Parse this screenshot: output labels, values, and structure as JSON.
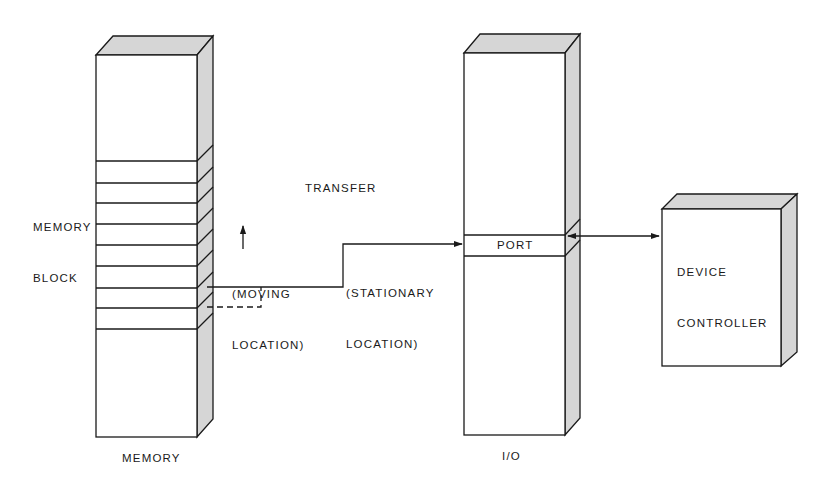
{
  "diagram": {
    "memory": {
      "label": "MEMORY",
      "block_label_line1": "MEMORY",
      "block_label_line2": "BLOCK",
      "moving_location_line1": "(MOVING",
      "moving_location_line2": "LOCATION)"
    },
    "transfer": {
      "label": "TRANSFER",
      "stationary_location_line1": "(STATIONARY",
      "stationary_location_line2": "LOCATION)"
    },
    "io": {
      "label": "I/O",
      "port_label": "PORT"
    },
    "device": {
      "label_line1": "DEVICE",
      "label_line2": "CONTROLLER"
    },
    "colors": {
      "line": "#1a1a1a",
      "shade": "#d6d6d6",
      "background": "#ffffff"
    }
  }
}
